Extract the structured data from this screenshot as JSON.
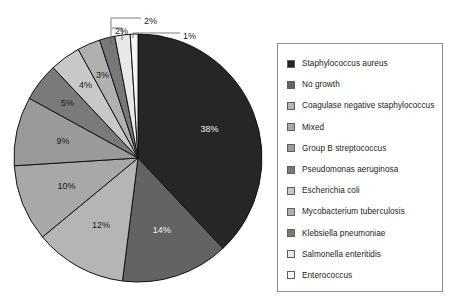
{
  "chart_data": {
    "type": "pie",
    "title": "",
    "subtitle": "",
    "xlabel": "",
    "ylabel": "",
    "legend_position": "right",
    "grid": false,
    "unit": "%",
    "start_angle_deg": 0,
    "direction": "clockwise",
    "categories": [
      "Staphylococcus aureus",
      "No growth",
      "Coagulase negative staphylococcus",
      "Mixed",
      "Group B streptococcus",
      "Pseudomonas aeruginosa",
      "Escherichia coli",
      "Mycobacterium tuberculosis",
      "Klebsiella pneumoniae",
      "Salmonella enteritidis",
      "Enterococcus"
    ],
    "values": [
      38,
      14,
      12,
      10,
      9,
      5,
      4,
      3,
      2,
      2,
      1
    ],
    "labels": [
      "38%",
      "14%",
      "12%",
      "10%",
      "9%",
      "5%",
      "4%",
      "3%",
      "2%",
      "2%",
      "1%"
    ],
    "colors": [
      "#262626",
      "#636363",
      "#b5b5b5",
      "#a8a8a8",
      "#9a9a9a",
      "#7a7a7a",
      "#c8c8c8",
      "#b0b0b0",
      "#787878",
      "#e8e8e8",
      "#f5f5f5"
    ],
    "label_placement": [
      "inside",
      "inside",
      "inside",
      "inside",
      "inside",
      "inside",
      "inside",
      "inside",
      "callout",
      "callout",
      "callout"
    ]
  },
  "legend": {
    "items": [
      {
        "label": "Staphylococcus aureus",
        "color": "#262626"
      },
      {
        "label": "No growth",
        "color": "#636363"
      },
      {
        "label": "Coagulase negative staphylococcus",
        "color": "#b5b5b5"
      },
      {
        "label": "Mixed",
        "color": "#a8a8a8"
      },
      {
        "label": "Group B streptococcus",
        "color": "#9a9a9a"
      },
      {
        "label": "Pseudomonas aeruginosa",
        "color": "#7a7a7a"
      },
      {
        "label": "Escherichia coli",
        "color": "#c8c8c8"
      },
      {
        "label": "Mycobacterium tuberculosis",
        "color": "#b0b0b0"
      },
      {
        "label": "Klebsiella pneumoniae",
        "color": "#787878"
      },
      {
        "label": "Salmonella enteritidis",
        "color": "#e8e8e8"
      },
      {
        "label": "Enterococcus",
        "color": "#f5f5f5"
      }
    ]
  },
  "callouts": [
    {
      "label": "2%",
      "x": 144,
      "y": 22
    },
    {
      "label": "2%",
      "x": 115,
      "y": 32
    },
    {
      "label": "1%",
      "x": 183,
      "y": 37
    }
  ]
}
